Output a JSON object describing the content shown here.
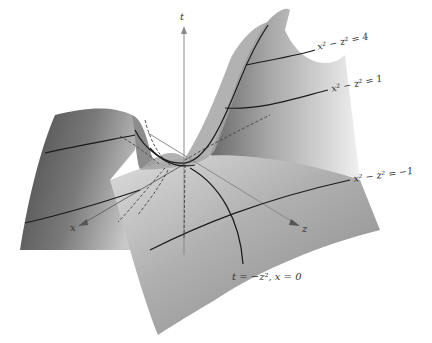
{
  "figure": {
    "type": "3d-surface-diagram",
    "axes": {
      "t": "t",
      "x": "x",
      "z": "z"
    },
    "curve_labels": {
      "level_4": "x² − z² = 4",
      "level_1": "x² − z² = 1",
      "level_neg1": "x² − z² = −1",
      "parabola": "t = −z², x = 0"
    },
    "colors": {
      "surface_dark": "#5a5a5a",
      "surface_light": "#e6e6e6",
      "curve": "#1a1a1a",
      "axis": "#888888",
      "background": "#ffffff"
    }
  }
}
